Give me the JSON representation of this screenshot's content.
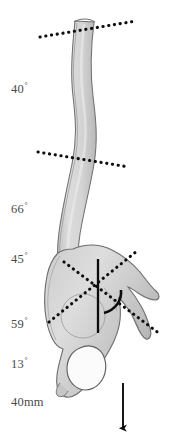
{
  "figure": {
    "width": 174,
    "height": 446,
    "background_color": "#ffffff"
  },
  "measurements": [
    {
      "id": "thoracic-kyphosis",
      "value": "40",
      "unit": "degree",
      "text": "40"
    },
    {
      "id": "lumbar-lordosis",
      "value": "66",
      "unit": "degree",
      "text": "66"
    },
    {
      "id": "sacral-slope",
      "value": "45",
      "unit": "degree",
      "text": "45"
    },
    {
      "id": "pelvic-incidence",
      "value": "59",
      "unit": "degree",
      "text": "59"
    },
    {
      "id": "pelvic-tilt",
      "value": "13",
      "unit": "degree",
      "text": "13"
    },
    {
      "id": "sagittal-vertical-axis",
      "value": "40",
      "unit": "mm",
      "text": "40mm"
    }
  ],
  "degree_symbol": "°",
  "anatomy": {
    "spine_label": "spine-column",
    "pelvis_label": "pelvis",
    "sacrum_label": "sacrum-vertebra-block",
    "femoral_head_label": "femoral-head-circle",
    "obturator_foramen_label": "obturator-foramen"
  },
  "annotations": {
    "upper_endplate_line": "dotted-reference-line-upper",
    "mid_endplate_line": "dotted-reference-line-mid",
    "sacral_endplate_line": "dotted-reference-line-sacral",
    "pelvic_incidence_line": "dotted-reference-line-pelvic",
    "vertical_plumb_line": "solid-vertical-reference-line",
    "angle_arc": "angle-arc-marker",
    "plumb_arrow": "downward-plumb-arrow"
  },
  "colors": {
    "bone_fill": "#d2d2d2",
    "bone_fill_dark": "#bcbcbc",
    "bone_fill_light": "#e2e2e2",
    "bone_outline": "#6e6e6e",
    "annotation": "#111111",
    "label_text": "#4a4a4a",
    "background": "#ffffff"
  }
}
